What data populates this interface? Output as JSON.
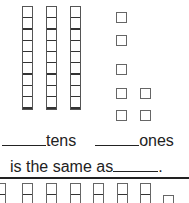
{
  "worksheet": {
    "tens_rods": 3,
    "ones_cubes": 7,
    "tens_label": "tens",
    "ones_label": "ones",
    "equivalence_text": "is the same as",
    "period": ".",
    "bottom_partial_rods": 7,
    "bottom_partial_cubes": 1
  }
}
